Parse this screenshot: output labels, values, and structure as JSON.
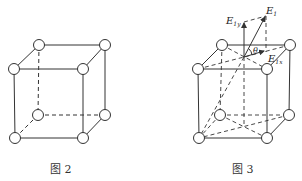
{
  "figures": [
    {
      "caption": "图 2",
      "type": "cube-lattice"
    },
    {
      "caption": "图 3",
      "type": "cube-lattice-with-field-vectors",
      "labels": {
        "E1": "E",
        "E1_sub": "1",
        "E1y": "E",
        "E1y_sub": "1y",
        "E1x": "E",
        "E1x_sub": "1x",
        "theta": "θ"
      }
    }
  ],
  "colors": {
    "line": "#333333",
    "background": "#ffffff"
  }
}
